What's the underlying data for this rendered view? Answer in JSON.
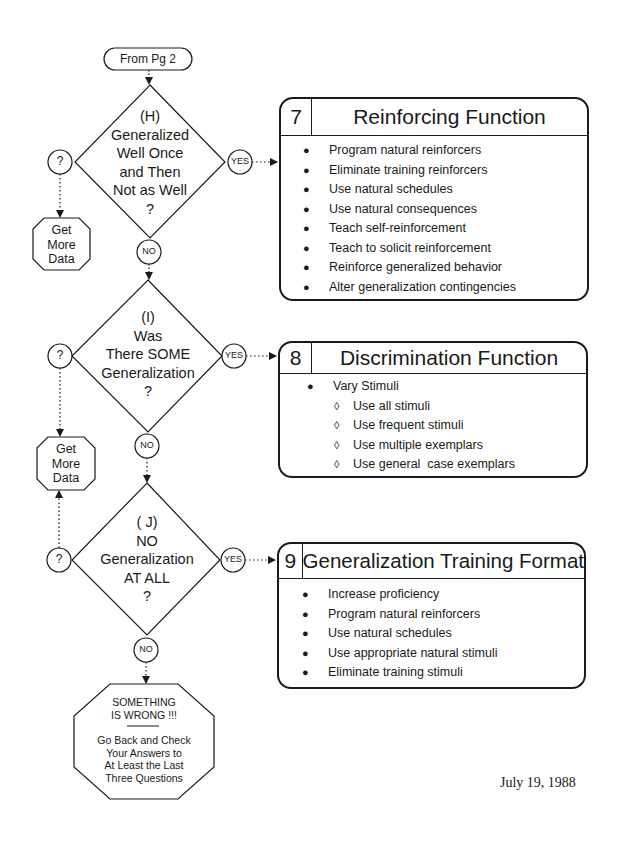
{
  "start": {
    "label": "From Pg 2"
  },
  "decisions": [
    {
      "id": "H",
      "lines": [
        "(H)",
        "Generalized",
        "Well Once",
        "and Then",
        "Not as Well",
        "?"
      ],
      "yes_label": "YES",
      "no_label": "NO",
      "unsure_label": "?"
    },
    {
      "id": "I",
      "lines": [
        "(I)",
        "Was",
        "There SOME",
        "Generalization",
        "?"
      ],
      "yes_label": "YES",
      "no_label": "NO",
      "unsure_label": "?"
    },
    {
      "id": "J",
      "lines": [
        "( J)",
        "NO",
        "Generalization",
        "AT ALL",
        "?"
      ],
      "yes_label": "YES",
      "no_label": "NO",
      "unsure_label": "?"
    }
  ],
  "get_more_data": [
    {
      "lines": [
        "Get",
        "More",
        "Data"
      ]
    },
    {
      "lines": [
        "Get",
        "More",
        "Data"
      ]
    }
  ],
  "boxes": [
    {
      "number": "7",
      "title": "Reinforcing Function",
      "items": [
        {
          "text": "Program natural reinforcers",
          "bullet": "apple",
          "level": 0
        },
        {
          "text": "Eliminate training reinforcers",
          "bullet": "apple",
          "level": 0
        },
        {
          "text": "Use natural schedules",
          "bullet": "apple",
          "level": 0
        },
        {
          "text": "Use natural consequences",
          "bullet": "apple",
          "level": 0
        },
        {
          "text": "Teach self-reinforcement",
          "bullet": "apple",
          "level": 0
        },
        {
          "text": "Teach to solicit reinforcement",
          "bullet": "apple",
          "level": 0
        },
        {
          "text": "Reinforce generalized behavior",
          "bullet": "apple",
          "level": 0
        },
        {
          "text": "Alter generalization contingencies",
          "bullet": "apple",
          "level": 0
        }
      ]
    },
    {
      "number": "8",
      "title": "Discrimination Function",
      "items": [
        {
          "text": "Vary Stimuli",
          "bullet": "apple",
          "level": 0
        },
        {
          "text": "Use all stimuli",
          "bullet": "diamond",
          "level": 1
        },
        {
          "text": "Use frequent stimuli",
          "bullet": "diamond",
          "level": 1
        },
        {
          "text": "Use multiple exemplars",
          "bullet": "diamond",
          "level": 1
        },
        {
          "text": "Use general  case exemplars",
          "bullet": "diamond",
          "level": 1
        }
      ]
    },
    {
      "number": "9",
      "title": "Generalization Training Format",
      "items": [
        {
          "text": "Increase proficiency",
          "bullet": "apple",
          "level": 0
        },
        {
          "text": "Program natural reinforcers",
          "bullet": "apple",
          "level": 0
        },
        {
          "text": "Use natural schedules",
          "bullet": "apple",
          "level": 0
        },
        {
          "text": "Use appropriate natural stimuli",
          "bullet": "apple",
          "level": 0
        },
        {
          "text": "Eliminate training stimuli",
          "bullet": "apple",
          "level": 0
        }
      ]
    }
  ],
  "error_stop": {
    "heading_lines": [
      "SOMETHING",
      "IS WRONG !!!"
    ],
    "body_lines": [
      "Go Back and Check",
      "Your Answers to",
      "At Least the Last",
      "Three Questions"
    ]
  },
  "date": "July 19, 1988",
  "bullet_glyphs": {
    "apple": "●",
    "diamond": "◊"
  }
}
